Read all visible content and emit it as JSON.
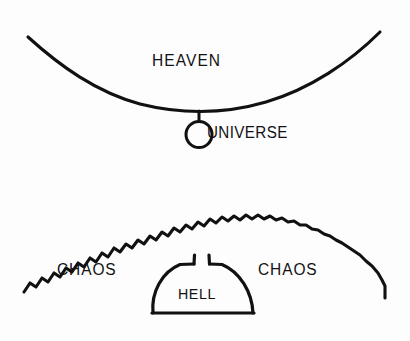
{
  "diagram": {
    "kind": "hand-drawn-cosmology-diagram",
    "background_color": "#fdfdfd",
    "ink_color": "#111111",
    "canvas": {
      "width": 410,
      "height": 341
    },
    "labels": {
      "heaven": "HEAVEN",
      "universe": "UNIVERSE",
      "chaos_left": "CHAOS",
      "chaos_right": "CHAOS",
      "hell": "HELL"
    },
    "elements": {
      "heaven_arc": {
        "name": "heaven-arc",
        "description": "smooth curve arcing downward, concave up",
        "start": [
          28,
          37
        ],
        "nadir": [
          200,
          110
        ],
        "end": [
          380,
          32
        ],
        "stroke_width": 3
      },
      "universe_stem": {
        "name": "universe-stem",
        "start": [
          199,
          111
        ],
        "end": [
          199,
          121
        ],
        "stroke_width": 3
      },
      "universe_circle": {
        "name": "universe-circle",
        "center": [
          199,
          134
        ],
        "radius": 13,
        "stroke_width": 3
      },
      "chaos_zigzag": {
        "name": "chaos-zigzag-arc",
        "description": "sawtooth arc arcing upward, convex up",
        "start": [
          24,
          292
        ],
        "apex": [
          205,
          213
        ],
        "end": [
          385,
          298
        ],
        "stroke_width": 3,
        "teeth": 44
      },
      "hell_dome": {
        "name": "hell-dome",
        "description": "domed enclosure with flat base and a notched gap at the apex",
        "left": 153,
        "right": 253,
        "base_y": 313,
        "apex_y": 263,
        "gap_width": 14,
        "stroke_width": 3
      }
    }
  }
}
